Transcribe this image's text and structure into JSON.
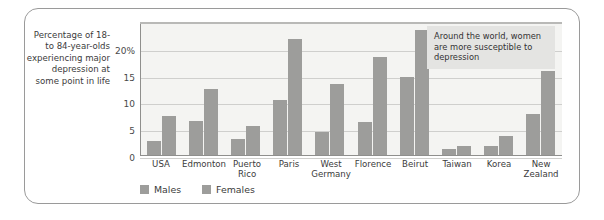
{
  "figure": {
    "y_caption": "Percentage of 18- to 84-year-olds experiencing major depression at some point in life",
    "annotation": "Around the world, women are more susceptible to depression"
  },
  "colors": {
    "bar": "#9d9d9b",
    "plot_background": "#f4f4f2",
    "gridline": "#cfcfcd",
    "annotation_background": "#e4e4e2",
    "frame_border": "#9a9a9a"
  },
  "chart_data": {
    "type": "bar",
    "title": "",
    "xlabel": "",
    "ylabel": "Percentage of 18- to 84-year-olds experiencing major depression at some point in life",
    "ylim": [
      0,
      25
    ],
    "yticks": [
      0,
      5,
      10,
      15,
      20
    ],
    "ytick_labels": [
      "0",
      "5",
      "10",
      "15",
      "20%"
    ],
    "grid": true,
    "legend_position": "bottom-left",
    "categories": [
      "USA",
      "Edmonton",
      "Puerto Rico",
      "Paris",
      "West Germany",
      "Florence",
      "Beirut",
      "Taiwan",
      "Korea",
      "New Zealand"
    ],
    "series": [
      {
        "name": "Males",
        "values": [
          2.8,
          6.5,
          3.2,
          10.5,
          4.5,
          6.3,
          14.8,
          1.3,
          1.9,
          7.8
        ]
      },
      {
        "name": "Females",
        "values": [
          7.5,
          12.5,
          5.6,
          21.8,
          13.5,
          18.5,
          23.5,
          1.8,
          3.8,
          15.8
        ]
      }
    ],
    "annotations": [
      "Around the world, women are more susceptible to depression"
    ]
  }
}
